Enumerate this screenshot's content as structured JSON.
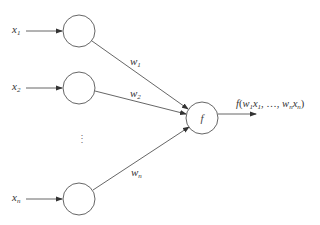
{
  "diagram": {
    "colors": {
      "stroke": "#555555",
      "text": "#333333",
      "background": "#ffffff"
    },
    "inputs": [
      {
        "var": "x",
        "sub": "1",
        "node": {
          "cx": 79,
          "cy": 31,
          "r": 16
        }
      },
      {
        "var": "x",
        "sub": "2",
        "node": {
          "cx": 79,
          "cy": 88,
          "r": 16
        }
      },
      {
        "var": "x",
        "sub": "n",
        "node": {
          "cx": 79,
          "cy": 199,
          "r": 16
        }
      }
    ],
    "ellipsis": "⋮",
    "weights": [
      {
        "var": "w",
        "sub": "1"
      },
      {
        "var": "w",
        "sub": "2"
      },
      {
        "var": "w",
        "sub": "n"
      }
    ],
    "output_node": {
      "label": "f",
      "cx": 202,
      "cy": 118,
      "r": 16
    },
    "output_label": {
      "func": "f",
      "open": "(",
      "w1": "w",
      "w1_sub": "1",
      "x1": "x",
      "x1_sub": "1",
      "sep": ", …, ",
      "wn": "w",
      "wn_sub": "n",
      "xn": "x",
      "xn_sub": "n",
      "close": ")"
    }
  }
}
